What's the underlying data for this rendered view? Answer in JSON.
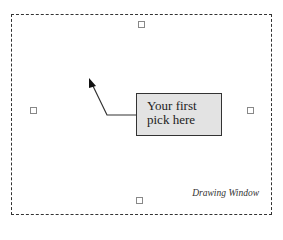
{
  "callout": {
    "line1": "Your first",
    "line2": "pick here"
  },
  "window": {
    "label": "Drawing Window"
  },
  "colors": {
    "callout_fill": "#e3e3e3",
    "border": "#333333"
  }
}
